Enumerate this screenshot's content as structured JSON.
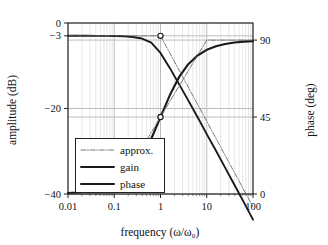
{
  "chart_data": {
    "type": "line",
    "title": "",
    "xlabel": "frequency (ω/ω₀)",
    "ylabel": "amplitude (dB)",
    "y2label": "phase (deg)",
    "xscale": "log",
    "xlim": [
      0.01,
      100
    ],
    "ylim": [
      -40,
      0
    ],
    "y2lim": [
      0,
      100
    ],
    "grid": true,
    "minor_grid": true,
    "legend_position": "lower-left-inside",
    "xticks": [
      "0.01",
      "0.1",
      "1",
      "10",
      "100"
    ],
    "xtick_values": [
      0.01,
      0.1,
      1,
      10,
      100
    ],
    "yticks": [
      "0",
      "−3",
      "−20",
      "−40"
    ],
    "ytick_values": [
      0,
      -3,
      -20,
      -40
    ],
    "y2ticks": [
      "90",
      "45",
      "0"
    ],
    "y2tick_values": [
      90,
      45,
      0
    ],
    "legend": [
      {
        "label": "approx.",
        "style": "dash-dot",
        "width": "thin"
      },
      {
        "label": "gain",
        "style": "solid",
        "width": "medium"
      },
      {
        "label": "phase",
        "style": "solid",
        "width": "thick"
      }
    ],
    "series": [
      {
        "name": "gain",
        "style": "solid",
        "axis": "left",
        "x": [
          0.01,
          0.0158,
          0.0251,
          0.0398,
          0.0631,
          0.1,
          0.1585,
          0.2512,
          0.3981,
          0.631,
          1.0,
          1.585,
          2.512,
          3.981,
          6.31,
          10.0,
          15.85,
          25.12,
          39.81,
          63.1,
          100.0
        ],
        "y": [
          -3.0,
          -3.0,
          -3.0,
          -3.01,
          -3.01,
          -3.04,
          -3.1,
          -3.26,
          -3.64,
          -4.6,
          -6.99,
          -10.5,
          -14.3,
          -18.1,
          -22.0,
          -26.0,
          -29.9,
          -33.9,
          -37.9,
          -41.9,
          -46.0
        ]
      },
      {
        "name": "gain approx.",
        "style": "dash-dot",
        "axis": "left",
        "x": [
          0.01,
          1.0,
          100.0
        ],
        "y": [
          -3.0,
          -3.0,
          -43.0
        ]
      },
      {
        "name": "phase",
        "style": "solid",
        "axis": "right",
        "x": [
          0.01,
          0.0158,
          0.0251,
          0.0398,
          0.0631,
          0.1,
          0.1585,
          0.2512,
          0.3981,
          0.631,
          1.0,
          1.585,
          2.512,
          3.981,
          6.31,
          10.0,
          15.85,
          25.12,
          39.81,
          63.1,
          100.0
        ],
        "y": [
          0.57,
          0.91,
          1.44,
          2.28,
          3.61,
          5.71,
          9.0,
          14.1,
          21.7,
          32.3,
          45.0,
          57.7,
          68.3,
          75.9,
          81.0,
          84.3,
          86.4,
          87.7,
          88.6,
          89.1,
          89.4
        ]
      },
      {
        "name": "phase approx.",
        "style": "dash-dot",
        "axis": "right",
        "x": [
          0.01,
          0.1,
          10.0,
          100.0
        ],
        "y": [
          0.0,
          0.0,
          90.0,
          90.0
        ]
      }
    ],
    "markers": [
      {
        "x": 1.0,
        "y": -3.0,
        "axis": "left",
        "series": "gain",
        "shape": "open-circle"
      },
      {
        "x": 1.0,
        "y": 45.0,
        "axis": "right",
        "series": "phase",
        "shape": "open-circle"
      }
    ],
    "colors": {
      "curve": "#1a1a1a",
      "approx": "#6a6a6a",
      "grid_major": "#b7b7b7",
      "grid_minor": "#d6d6d6",
      "frame": "#222222",
      "background": "#ffffff"
    }
  }
}
